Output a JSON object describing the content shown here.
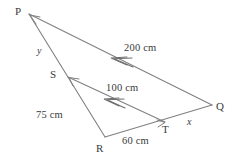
{
  "figure": {
    "type": "geometry-diagram",
    "shape": "triangle-with-parallel-transversal",
    "background_color": "#ffffff",
    "line_color": "#808080",
    "text_color": "#3a3a3a"
  },
  "vertices": {
    "p": {
      "label": "P",
      "x": 29,
      "y": 14,
      "label_x": 15,
      "label_y": 6
    },
    "q": {
      "label": "Q",
      "x": 212,
      "y": 105,
      "label_x": 216,
      "label_y": 101
    },
    "r": {
      "label": "R",
      "x": 105,
      "y": 137,
      "label_x": 96,
      "label_y": 143
    },
    "s": {
      "label": "S",
      "x": 68,
      "y": 77,
      "label_x": 50,
      "label_y": 69
    },
    "t": {
      "label": "T",
      "x": 165,
      "y": 122,
      "label_x": 162,
      "label_y": 124
    }
  },
  "measurements": {
    "pq": {
      "text": "200 cm",
      "x": 124,
      "y": 43
    },
    "st": {
      "text": "100 cm",
      "x": 106,
      "y": 83
    },
    "sr": {
      "text": "75 cm",
      "x": 36,
      "y": 110
    },
    "rt": {
      "text": "60 cm",
      "x": 122,
      "y": 136
    }
  },
  "unknowns": {
    "ps": {
      "text": "y",
      "x": 37,
      "y": 46
    },
    "tq": {
      "text": "x",
      "x": 187,
      "y": 117
    }
  },
  "parallel_marks": {
    "pq_arrow": {
      "name": "double-chevron-arrow",
      "count": 2
    },
    "st_arrow": {
      "name": "double-chevron-arrow",
      "count": 2
    }
  }
}
